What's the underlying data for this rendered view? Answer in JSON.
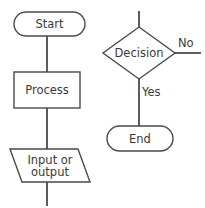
{
  "diagram": {
    "type": "flowchart",
    "stroke_color": "#4a4a4a",
    "text_color": "#3a3a3a",
    "background_color": "#ffffff",
    "nodes": [
      {
        "id": "start",
        "label": "Start",
        "shape": "terminator",
        "shape_name": "rounded-rectangle"
      },
      {
        "id": "process",
        "label": "Process",
        "shape": "process",
        "shape_name": "rectangle"
      },
      {
        "id": "io",
        "label_line1": "Input or",
        "label_line2": "output",
        "shape": "data",
        "shape_name": "parallelogram"
      },
      {
        "id": "decision",
        "label": "Decision",
        "shape": "decision",
        "shape_name": "diamond"
      },
      {
        "id": "end",
        "label": "End",
        "shape": "terminator",
        "shape_name": "rounded-rectangle"
      }
    ],
    "edge_labels": {
      "no": "No",
      "yes": "Yes"
    }
  }
}
